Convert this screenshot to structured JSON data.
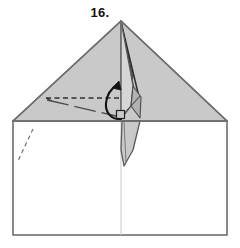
{
  "figure": {
    "step_label": "16.",
    "kind": "origami-fold-diagram",
    "caption_position": "top-center"
  },
  "colors": {
    "paper_front": "#c9c9c9",
    "paper_back": "#ffffff",
    "paper_shadow": "#b5b5b5",
    "paper_highlight": "#d8d8d8",
    "outline": "#6e6e6e",
    "outline_dark": "#2b2b2b",
    "crease_line": "#9a9a9a",
    "dashed_fold": "#3a3a3a",
    "arrow": "#1a1a1a",
    "label_text": "#111111",
    "background": "#ffffff"
  },
  "geometry": {
    "canvas": {
      "width": 240,
      "height": 248
    },
    "body_rect": {
      "left": 13,
      "top": 121,
      "right": 227,
      "bottom": 235
    },
    "roof_apex": {
      "x": 121,
      "y": 21
    },
    "roof_left_corner": {
      "x": 13,
      "y": 121
    },
    "roof_right_corner": {
      "x": 227,
      "y": 121
    },
    "center_line_x": 121,
    "horizontal_edge_y": 121,
    "standing_flap_top": {
      "x": 121,
      "y": 21
    },
    "standing_flap_bottom": {
      "x": 124,
      "y": 166
    },
    "right_angle_marker": {
      "x": 117,
      "y": 111,
      "size": 7
    }
  },
  "annotations": {
    "valley_fold_horizontal": {
      "name": "horizontal-dashed-fold-line",
      "style": "dashed",
      "from": {
        "x": 46,
        "y": 98
      },
      "to": {
        "x": 120,
        "y": 98
      }
    },
    "reference_dash_dot": {
      "name": "diagonal-dash-dot-line",
      "style": "dash-dot",
      "from": {
        "x": 47,
        "y": 99
      },
      "to": {
        "x": 118,
        "y": 116
      }
    },
    "hidden_edge_dashed": {
      "name": "hidden-edge-dashed-line",
      "style": "dashed",
      "from": {
        "x": 33,
        "y": 130
      },
      "to": {
        "x": 17,
        "y": 163
      }
    },
    "rotation_arrow": {
      "name": "curved-rotation-arrow",
      "direction": "counter-clockwise-up",
      "tail": {
        "x": 118,
        "y": 118
      },
      "head": {
        "x": 117,
        "y": 84
      }
    }
  },
  "layers": [
    {
      "name": "roof-triangle-left",
      "fill": "paper_front"
    },
    {
      "name": "roof-triangle-right",
      "fill": "paper_front"
    },
    {
      "name": "standing-flap",
      "fill": "paper_highlight"
    },
    {
      "name": "flap-shadow-panel",
      "fill": "paper_shadow"
    },
    {
      "name": "body-rectangle",
      "fill": "paper_back"
    }
  ]
}
